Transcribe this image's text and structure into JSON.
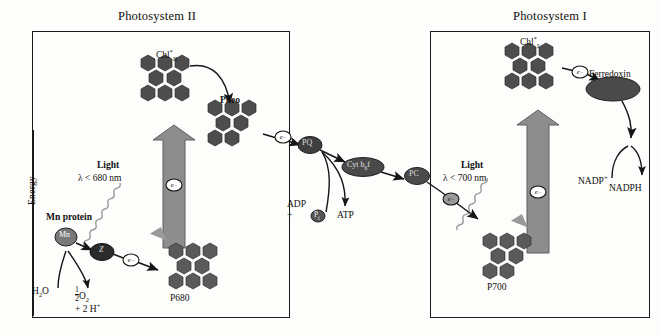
{
  "diagram": {
    "title_ps2": "Photosystem II",
    "title_ps1": "Photosystem I",
    "axis_label": "Energy"
  },
  "photosystem2": {
    "chl_excited": "Chl",
    "chl_excited_star": "*",
    "chl_excited_sub": "II",
    "pheo": "Pheo",
    "p680": "P680",
    "light_label": "Light",
    "light_wavelength": "λ < 680 nm",
    "mn_protein": "Mn protein",
    "mn_label": "Mn",
    "carrier_label": "Z",
    "water": "H",
    "water_sub": "2",
    "water_o": "O",
    "oxygen_num": "1",
    "oxygen_den": "2",
    "oxygen": "O",
    "oxygen_sub": "2",
    "protons": "+ 2 H",
    "protons_sup": "+",
    "electron": "e",
    "electron_sup": "−"
  },
  "chain": {
    "pq": "PQ",
    "cytb6f": "Cyt b",
    "cytb6f_sub": "6",
    "cytb6f_tail": "f",
    "pc": "PC",
    "adp": "ADP",
    "plus_pi": "+",
    "pi": "P",
    "pi_sub": "i",
    "atp": "ATP"
  },
  "photosystem1": {
    "chl_excited": "Chl",
    "chl_excited_star": "*",
    "chl_excited_sub": "I",
    "ferredoxin": "Ferredoxin",
    "p700": "P700",
    "light_label": "Light",
    "light_wavelength": "λ < 700 nm",
    "nadp": "NADP",
    "nadp_sup": "+",
    "nadph": "NADPH"
  },
  "colors": {
    "ink": "#1a1a1a",
    "complex_dark": "#4a4a4a",
    "complex_mid": "#5e5e5e",
    "arrow_gray": "#8d8d8d",
    "ellipse_dark": "#3d3d3d",
    "paper": "#fdfdfb"
  }
}
